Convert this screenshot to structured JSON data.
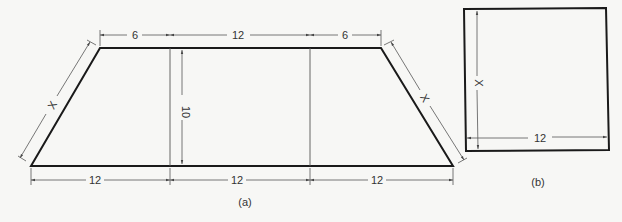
{
  "figure_a": {
    "caption": "(a)",
    "shape": "trapezoid",
    "top_segments": [
      "6",
      "12",
      "6"
    ],
    "bottom_segments": [
      "12",
      "12",
      "12"
    ],
    "height_label": "10",
    "left_slant_label": "X",
    "right_slant_label": "X"
  },
  "figure_b": {
    "caption": "(b)",
    "shape": "rectangle",
    "height_label": "X",
    "width_label": "12"
  },
  "colors": {
    "background": "#f7f7f5",
    "outline": "#1a1a1a",
    "dimension": "#555555"
  }
}
